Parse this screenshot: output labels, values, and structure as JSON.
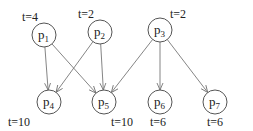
{
  "diagram": {
    "type": "task-dependency-graph",
    "nodes": [
      {
        "id": "p1",
        "base": "p",
        "sub": "1",
        "time": "t=4",
        "x": 44,
        "y": 35,
        "tx": 22,
        "ty": 21
      },
      {
        "id": "p2",
        "base": "p",
        "sub": "2",
        "time": "t=2",
        "x": 100,
        "y": 32,
        "tx": 78,
        "ty": 18
      },
      {
        "id": "p3",
        "base": "p",
        "sub": "3",
        "time": "t=2",
        "x": 160,
        "y": 30,
        "tx": 170,
        "ty": 18
      },
      {
        "id": "p4",
        "base": "p",
        "sub": "4",
        "time": "t=10",
        "x": 49,
        "y": 102,
        "tx": 8,
        "ty": 126
      },
      {
        "id": "p5",
        "base": "p",
        "sub": "5",
        "time": "t=10",
        "x": 104,
        "y": 102,
        "tx": 111,
        "ty": 126
      },
      {
        "id": "p6",
        "base": "p",
        "sub": "6",
        "time": "t=6",
        "x": 160,
        "y": 102,
        "tx": 150,
        "ty": 126
      },
      {
        "id": "p7",
        "base": "p",
        "sub": "7",
        "time": "t=6",
        "x": 215,
        "y": 102,
        "tx": 207,
        "ty": 126
      }
    ],
    "edges": [
      {
        "from": "p1",
        "to": "p4"
      },
      {
        "from": "p1",
        "to": "p5"
      },
      {
        "from": "p2",
        "to": "p4"
      },
      {
        "from": "p2",
        "to": "p5"
      },
      {
        "from": "p3",
        "to": "p5"
      },
      {
        "from": "p3",
        "to": "p6"
      },
      {
        "from": "p3",
        "to": "p7"
      }
    ]
  }
}
